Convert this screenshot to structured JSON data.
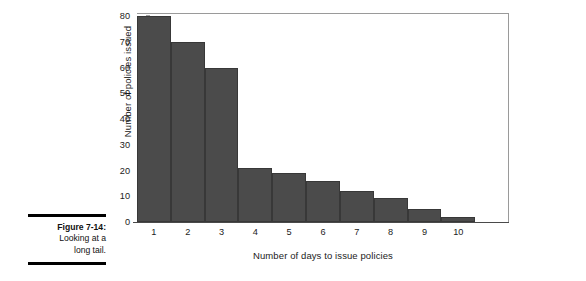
{
  "caption": {
    "figure_number": "Figure 7-14:",
    "line_1": "Looking at a",
    "line_2": "long tail."
  },
  "chart_data": {
    "type": "bar",
    "title": "",
    "xlabel": "Number of days to issue policies",
    "ylabel": "Number of policies issued",
    "categories": [
      "1",
      "2",
      "3",
      "4",
      "5",
      "6",
      "7",
      "8",
      "9",
      "10"
    ],
    "values": [
      80,
      70,
      60,
      21,
      19,
      16,
      12,
      9.5,
      5,
      2
    ],
    "ylim": [
      0,
      80
    ],
    "y_ticks": [
      0,
      10,
      20,
      30,
      40,
      50,
      60,
      70,
      80
    ],
    "y_tick_labels": [
      "0",
      "10",
      "20",
      "30",
      "40",
      "50",
      "60",
      "70",
      "80"
    ],
    "grid": false,
    "legend": false,
    "bar_color": "#4b4b4b",
    "bar_edge_color": "#383838",
    "frame_color": "#9a9a9a"
  }
}
